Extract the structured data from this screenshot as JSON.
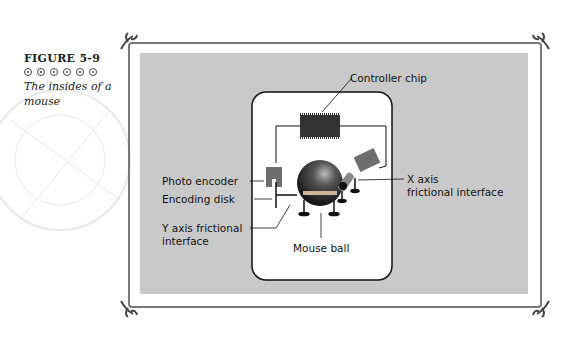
{
  "figure": {
    "number": "FIGURE 5-9",
    "bullet_count": 6,
    "description": "The insides of a mouse"
  },
  "diagram": {
    "labels": {
      "controller_chip": "Controller chip",
      "photo_encoder": "Photo encoder",
      "encoding_disk": "Encoding disk",
      "y_axis_line1": "Y axis frictional",
      "y_axis_line2": "interface",
      "mouse_ball": "Mouse ball",
      "x_axis_line1": "X axis",
      "x_axis_line2": "frictional interface"
    },
    "colors": {
      "panel_bg": "#c9c9c9",
      "mouse_body": "#ffffff",
      "chip": "#3a3a3a",
      "encoder": "#6e6e6e",
      "ball": "#2b2b2b"
    }
  }
}
